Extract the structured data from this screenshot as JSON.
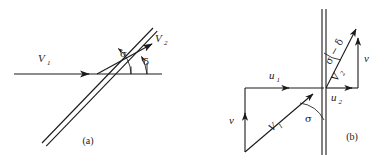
{
  "figure": {
    "colors": {
      "ink": "#1a1a1a",
      "background": "#ffffff"
    },
    "panels": [
      {
        "id": "a",
        "caption": "(a)",
        "description": "Oblique shock wave with incoming and outgoing velocity vectors",
        "labels": {
          "incoming_velocity": "V",
          "incoming_velocity_sub": "1",
          "outgoing_velocity": "V",
          "outgoing_velocity_sub": "2",
          "wave_angle": "σ",
          "deflection_angle": "δ"
        }
      },
      {
        "id": "b",
        "caption": "(b)",
        "description": "Velocity components normal and tangential to the shock front",
        "labels": {
          "incoming_velocity": "V",
          "incoming_velocity_sub": "1",
          "outgoing_velocity": "V",
          "outgoing_velocity_sub": "2",
          "tangential_upstream": "u",
          "tangential_upstream_sub": "1",
          "tangential_downstream": "u",
          "tangential_downstream_sub": "2",
          "normal_upstream": "v",
          "normal_downstream": "v",
          "wave_angle": "σ",
          "angle_difference": "σ − δ"
        }
      }
    ]
  }
}
